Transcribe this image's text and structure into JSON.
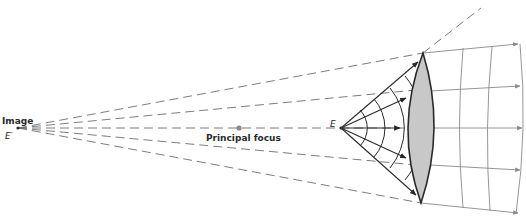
{
  "figure": {
    "labels": {
      "image": "Image",
      "image_point": "E′",
      "principal_focus": "Principal focus",
      "object_point": "E"
    },
    "colors": {
      "lens_fill": "#c8c8c8",
      "lens_stroke": "#2a2a2a",
      "ray": "#2a2a2a",
      "dashed": "#6e6e6e",
      "wavefront_out": "#8a8a8a",
      "focus_dot": "#8a8a8a"
    }
  }
}
